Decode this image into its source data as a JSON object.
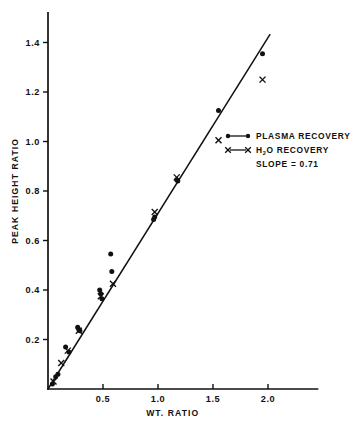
{
  "chart_data": {
    "type": "scatter",
    "title": "",
    "xlabel": "WT. RATIO",
    "ylabel": "PEAK HEIGHT RATIO",
    "xlim": [
      0.0,
      2.45
    ],
    "ylim": [
      0.0,
      1.52
    ],
    "xticks": [
      0.5,
      1.0,
      1.5,
      2.0
    ],
    "xtick_labels": [
      "0.5",
      "1.0",
      "1.5",
      "2.0"
    ],
    "yticks": [
      0.2,
      0.4,
      0.6,
      0.8,
      1.0,
      1.2,
      1.4
    ],
    "ytick_labels": [
      "0.2",
      "0.4",
      "0.6",
      "0.8",
      "1.0",
      "1.2",
      "1.4"
    ],
    "grid": false,
    "legend_position": "center-right",
    "fit_line": {
      "label": "SLOPE = 0.71",
      "slope": 0.71,
      "intercept": 0.0,
      "x_start": 0.0,
      "x_end": 2.02
    },
    "series": [
      {
        "name": "PLASMA RECOVERY",
        "marker": "dot",
        "points": [
          [
            0.04,
            0.02
          ],
          [
            0.07,
            0.05
          ],
          [
            0.09,
            0.06
          ],
          [
            0.16,
            0.17
          ],
          [
            0.19,
            0.15
          ],
          [
            0.27,
            0.25
          ],
          [
            0.28,
            0.24
          ],
          [
            0.29,
            0.235
          ],
          [
            0.47,
            0.4
          ],
          [
            0.48,
            0.385
          ],
          [
            0.49,
            0.365
          ],
          [
            0.57,
            0.545
          ],
          [
            0.58,
            0.475
          ],
          [
            0.96,
            0.685
          ],
          [
            0.97,
            0.695
          ],
          [
            1.17,
            0.845
          ],
          [
            1.18,
            0.84
          ],
          [
            1.55,
            1.125
          ],
          [
            1.95,
            1.355
          ]
        ]
      },
      {
        "name": "H2O RECOVERY",
        "marker": "cross",
        "points": [
          [
            0.05,
            0.03
          ],
          [
            0.12,
            0.105
          ],
          [
            0.18,
            0.155
          ],
          [
            0.28,
            0.235
          ],
          [
            0.48,
            0.375
          ],
          [
            0.59,
            0.425
          ],
          [
            0.97,
            0.715
          ],
          [
            1.17,
            0.855
          ],
          [
            1.55,
            1.005
          ],
          [
            1.95,
            1.25
          ]
        ]
      }
    ]
  },
  "legend": {
    "items": [
      {
        "label": "PLASMA RECOVERY",
        "marker": "dot"
      },
      {
        "label_pre": "H",
        "label_sub": "2",
        "label_post": "O RECOVERY",
        "marker": "cross"
      }
    ],
    "slope_text": "SLOPE = 0.71"
  },
  "colors": {
    "ink": "#111111",
    "background": "#ffffff"
  }
}
